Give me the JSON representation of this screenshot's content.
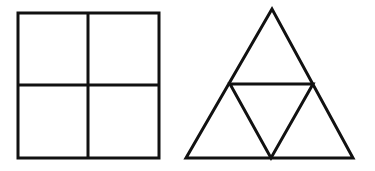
{
  "diagram": {
    "background": "#ffffff",
    "stroke_color": "#111111",
    "stroke_width": 3,
    "shapes": [
      {
        "name": "square-divided-into-four",
        "type": "square",
        "x": 18,
        "y": 13,
        "size": 141,
        "divisions": "2x2"
      },
      {
        "name": "triangle-divided-into-four",
        "type": "triangle",
        "apex": [
          272,
          9
        ],
        "base_left": [
          186,
          158
        ],
        "base_right": [
          353,
          158
        ],
        "inner_vertices": [
          [
            230,
            84
          ],
          [
            313,
            84
          ],
          [
            271,
            158
          ]
        ]
      }
    ]
  }
}
